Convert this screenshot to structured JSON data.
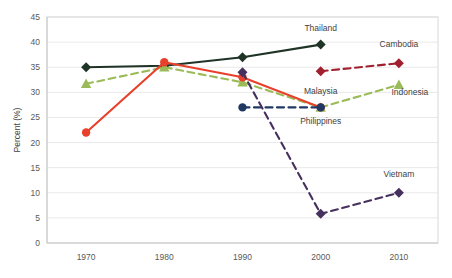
{
  "chart_data": {
    "type": "line",
    "title": "",
    "xlabel": "",
    "ylabel": "Percent (%)",
    "x": [
      1970,
      1980,
      1990,
      2000,
      2010
    ],
    "categories": [
      "1970",
      "1980",
      "1990",
      "2000",
      "2010"
    ],
    "xlim": [
      1965,
      2015
    ],
    "ylim": [
      0,
      45
    ],
    "ytick_step": 5,
    "yticks": [
      0,
      5,
      10,
      15,
      20,
      25,
      30,
      35,
      40,
      45
    ],
    "ytick_labels": [
      "0",
      "5",
      "10",
      "15",
      "20",
      "25",
      "30",
      "35",
      "40",
      "45"
    ],
    "grid": true,
    "grid_axis": "y",
    "legend": "inline-labels",
    "series": [
      {
        "name": "Thailand",
        "color": "#1f3326",
        "marker": "diamond",
        "line_style": "solid",
        "x": [
          1970,
          1980,
          1990,
          2000
        ],
        "values": [
          35.0,
          35.3,
          37.0,
          39.5
        ],
        "label_x": 2000,
        "label_y": 42.2,
        "label_anchor": "middle"
      },
      {
        "name": "Indonesia",
        "color": "#9bbb59",
        "marker": "triangle",
        "line_style": "dashed",
        "x": [
          1970,
          1980,
          1990,
          2000,
          2010
        ],
        "values": [
          31.7,
          35.0,
          32.0,
          27.0,
          31.5
        ],
        "label_x": 2011.4,
        "label_y": 29.4,
        "label_anchor": "middle"
      },
      {
        "name": "Malaysia",
        "color": "#e8402a",
        "marker": "circle",
        "line_style": "solid",
        "x": [
          1970,
          1980,
          1990,
          2000
        ],
        "values": [
          22.0,
          36.0,
          33.0,
          27.0
        ],
        "label_x": 2000,
        "label_y": 29.6,
        "label_anchor": "middle"
      },
      {
        "name": "Philippines",
        "color": "#1f3864",
        "marker": "circle",
        "line_style": "dashed",
        "x": [
          1990,
          2000
        ],
        "values": [
          27.0,
          27.0
        ],
        "label_x": 2000,
        "label_y": 23.6,
        "label_anchor": "middle"
      },
      {
        "name": "Cambodia",
        "color": "#a02030",
        "marker": "diamond",
        "line_style": "dashed",
        "x": [
          2000,
          2010
        ],
        "values": [
          34.2,
          35.8
        ],
        "label_x": 2010,
        "label_y": 39.0,
        "label_anchor": "middle"
      },
      {
        "name": "Vietnam",
        "color": "#46305e",
        "marker": "diamond",
        "line_style": "dashed",
        "x": [
          1990,
          2000,
          2010
        ],
        "values": [
          34.0,
          5.8,
          10.0
        ],
        "label_x": 2010,
        "label_y": 13.2,
        "label_anchor": "middle"
      }
    ]
  }
}
